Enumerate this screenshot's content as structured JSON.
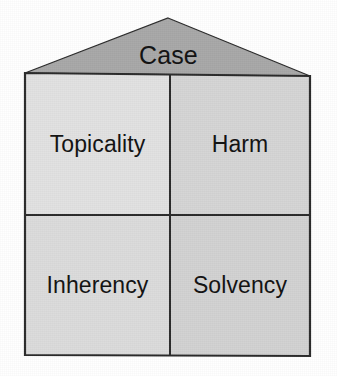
{
  "diagram": {
    "title": "Case",
    "shape": "house",
    "roof": {
      "label": "Case",
      "fill": "#a8a8a8",
      "stroke": "#2b2b2b",
      "apex": {
        "x": 168,
        "y": 18
      },
      "base_left": {
        "x": 25,
        "y": 73
      },
      "base_right": {
        "x": 310,
        "y": 76
      }
    },
    "body": {
      "stroke": "#2b2b2b",
      "left": 25,
      "top": 73,
      "right": 310,
      "bottom": 356,
      "divider_x": 170,
      "divider_y": 215
    },
    "quadrants": [
      {
        "id": "topicality",
        "label": "Topicality",
        "position": "top-left",
        "fill": "#e2e2e2"
      },
      {
        "id": "harm",
        "label": "Harm",
        "position": "top-right",
        "fill": "#d5d5d5"
      },
      {
        "id": "inherency",
        "label": "Inherency",
        "position": "bottom-left",
        "fill": "#dcdcdc"
      },
      {
        "id": "solvency",
        "label": "Solvency",
        "position": "bottom-right",
        "fill": "#d2d2d2"
      }
    ],
    "colors": {
      "background": "#ffffff",
      "text": "#141414",
      "outline": "#2b2b2b",
      "roof_fill": "#a8a8a8"
    }
  }
}
